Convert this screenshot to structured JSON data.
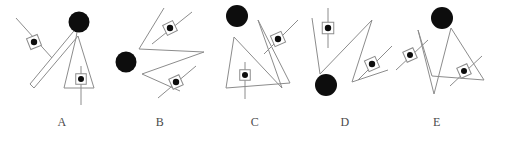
{
  "page": {
    "background_color": "#ffffff",
    "width": 509,
    "height": 143,
    "stroke_color": "#8c8c8c",
    "fill_color": "#0d0d0d",
    "label_color": "#4a4a4a"
  },
  "figures": [
    {
      "id": "A",
      "label": "A",
      "label_x": 62,
      "panel_x": 8,
      "panel_width": 100,
      "circle": {
        "cx": 71,
        "cy": 22,
        "r": 10.5
      },
      "polyline": "70,26 22,84 26,88 70,36 86,88 56,88 68,38 70,26",
      "markers": [
        {
          "cx": 26,
          "cy": 42,
          "size": 11.5,
          "rot": -22,
          "dot_r": 3.2,
          "tick": "8,18 44,58"
        },
        {
          "cx": 73,
          "cy": 79,
          "size": 10.5,
          "rot": 0,
          "dot_r": 3.0,
          "tick": "73,66 73,105"
        }
      ]
    },
    {
      "id": "B",
      "label": "B",
      "label_x": 160,
      "panel_x": 108,
      "panel_width": 100,
      "circle": {
        "cx": 18,
        "cy": 62,
        "r": 10.5
      },
      "polyline": "56,8 31,49 96,52 34,74 72,91",
      "markers": [
        {
          "cx": 62,
          "cy": 28,
          "size": 11.0,
          "rot": -26,
          "dot_r": 3.2,
          "tick": "44,44 84,12"
        },
        {
          "cx": 68,
          "cy": 82,
          "size": 11.0,
          "rot": -24,
          "dot_r": 3.2,
          "tick": "50,98 88,66"
        }
      ]
    },
    {
      "id": "C",
      "label": "C",
      "label_x": 255,
      "panel_x": 212,
      "panel_width": 100,
      "circle": {
        "cx": 25,
        "cy": 16,
        "r": 11.0
      },
      "polyline": "22,37 14,88 78,83 46,20 70,88 22,37",
      "markers": [
        {
          "cx": 66,
          "cy": 39,
          "size": 11.5,
          "rot": -24,
          "dot_r": 3.2,
          "tick": "52,54 86,20"
        },
        {
          "cx": 33,
          "cy": 75,
          "size": 10.5,
          "rot": 0,
          "dot_r": 3.0,
          "tick": "33,62 33,99"
        }
      ]
    },
    {
      "id": "D",
      "label": "D",
      "label_x": 345,
      "panel_x": 302,
      "panel_width": 100,
      "circle": {
        "cx": 24,
        "cy": 85,
        "r": 11.0
      },
      "polyline": "10,18 18,74 70,20 50,82 86,70",
      "markers": [
        {
          "cx": 26,
          "cy": 28,
          "size": 11.5,
          "rot": 0,
          "dot_r": 3.2,
          "tick": "26,8 26,48"
        },
        {
          "cx": 70,
          "cy": 64,
          "size": 11.5,
          "rot": -24,
          "dot_r": 3.2,
          "tick": "56,80 90,46"
        }
      ]
    },
    {
      "id": "E",
      "label": "E",
      "label_x": 437,
      "panel_x": 398,
      "panel_width": 108,
      "circle": {
        "cx": 44,
        "cy": 18,
        "r": 11.0
      },
      "polyline": "20,30 36,94 53,28 86,80 34,76 20,30",
      "markers": [
        {
          "cx": 12,
          "cy": 55,
          "size": 11.0,
          "rot": -24,
          "dot_r": 3.0,
          "tick": "-2,70 30,40"
        },
        {
          "cx": 66,
          "cy": 71,
          "size": 11.0,
          "rot": -24,
          "dot_r": 3.0,
          "tick": "52,86 84,56"
        }
      ]
    }
  ]
}
